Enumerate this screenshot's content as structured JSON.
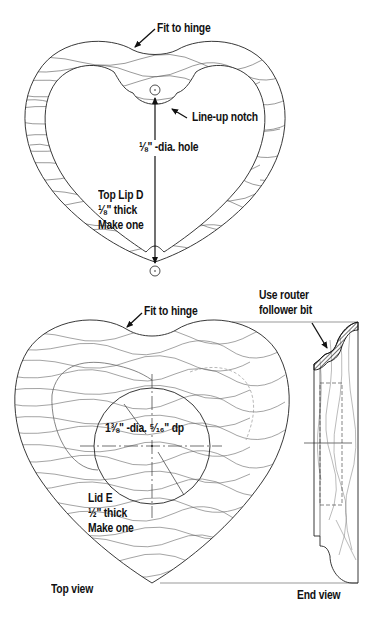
{
  "figure": {
    "top_lip": {
      "part_name": "Top Lip D",
      "thickness": "⅛\" thick",
      "quantity": "Make one",
      "callouts": {
        "hinge": "Fit to hinge",
        "notch": "Line-up notch",
        "hole": "⅛\" -dia. hole"
      }
    },
    "lid": {
      "part_name": "Lid E",
      "thickness": "½\" thick",
      "quantity": "Make one",
      "callouts": {
        "hinge": "Fit to hinge",
        "recess": "1⅜\" -dia. ⁵⁄₁₆\" dp",
        "router": [
          "Use router",
          "follower bit"
        ]
      }
    },
    "views": {
      "top": "Top view",
      "end": "End view"
    },
    "colors": {
      "line": "#222222",
      "grain": "#555555",
      "background": "#ffffff"
    }
  }
}
